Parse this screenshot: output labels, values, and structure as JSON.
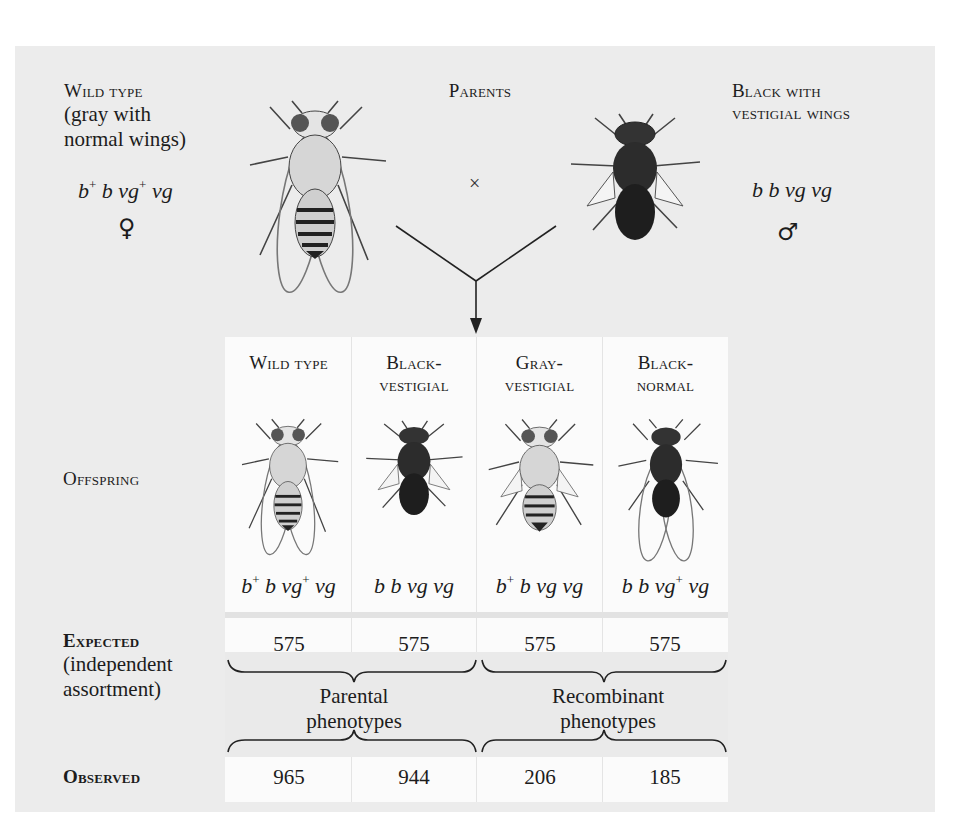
{
  "parents": {
    "heading": "Parents",
    "cross_symbol": "×",
    "female": {
      "title": "Wild type",
      "description_line1": "(gray with",
      "description_line2": "normal wings)",
      "genotype_parts": [
        "b",
        "+",
        " b vg",
        "+",
        " vg"
      ],
      "sex_symbol": "♀",
      "body_color": "#d8d8d8"
    },
    "male": {
      "title_line1": "Black with",
      "title_line2": "vestigial wings",
      "genotype": "b b vg vg",
      "sex_symbol": "♂",
      "body_color": "#2a2a2a"
    }
  },
  "offspring": {
    "row_label": "Offspring",
    "columns": [
      {
        "title_line1": "Wild type",
        "title_line2": "",
        "genotype_parts": [
          "b",
          "+",
          " b vg",
          "+",
          " vg"
        ],
        "expected": "575",
        "observed": "965",
        "body": "gray",
        "wings": "normal"
      },
      {
        "title_line1": "Black-",
        "title_line2": "vestigial",
        "genotype_parts": [
          "b b vg vg",
          "",
          "",
          "",
          ""
        ],
        "expected": "575",
        "observed": "944",
        "body": "black",
        "wings": "vestigial"
      },
      {
        "title_line1": "Gray-",
        "title_line2": "vestigial",
        "genotype_parts": [
          "b",
          "+",
          " b vg vg",
          "",
          ""
        ],
        "expected": "575",
        "observed": "206",
        "body": "gray",
        "wings": "vestigial"
      },
      {
        "title_line1": "Black-",
        "title_line2": "normal",
        "genotype_parts": [
          "b b vg",
          "+",
          " vg",
          "",
          ""
        ],
        "expected": "575",
        "observed": "185",
        "body": "black",
        "wings": "normal"
      }
    ]
  },
  "expected_row": {
    "label": "Expected",
    "sub_line1": "(independent",
    "sub_line2": "assortment)"
  },
  "observed_row": {
    "label": "Observed"
  },
  "groups": {
    "parental_line1": "Parental",
    "parental_line2": "phenotypes",
    "recombinant_line1": "Recombinant",
    "recombinant_line2": "phenotypes"
  },
  "colors": {
    "panel_background": "#ececec",
    "table_background": "#fbfbfb",
    "text": "#1c1c1c"
  }
}
